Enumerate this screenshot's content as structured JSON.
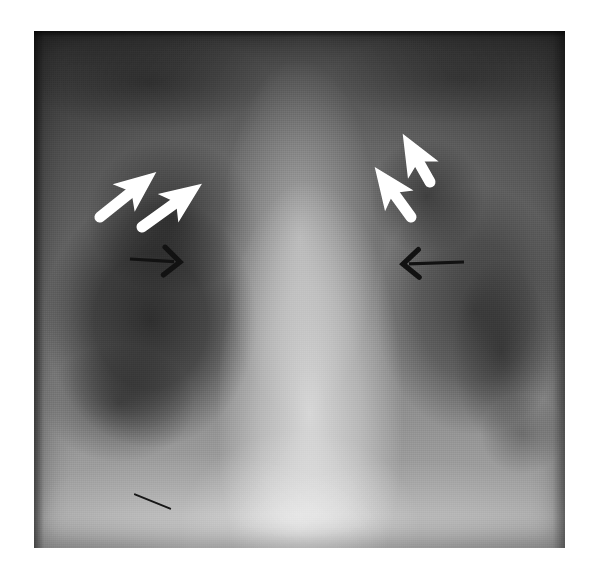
{
  "figure": {
    "type": "chest-radiograph",
    "modality": "X-ray",
    "view": "frontal PA chest",
    "background_color": "#ffffff",
    "plate": {
      "x": 34,
      "y": 31,
      "width": 531,
      "height": 517,
      "left_lung_tone": "lucent dark",
      "right_lung_tone": "mottled opacity",
      "mediastinum_tone": "bright central column"
    }
  },
  "annotations": {
    "white_arrows": [
      {
        "id": "white-arrow-left-outer",
        "color": "#ffffff",
        "points_to": "up-right",
        "tail_x": 66,
        "tail_y": 186,
        "head_x": 106,
        "head_y": 154
      },
      {
        "id": "white-arrow-left-inner",
        "color": "#ffffff",
        "points_to": "up-right",
        "tail_x": 108,
        "tail_y": 196,
        "head_x": 151,
        "head_y": 165
      },
      {
        "id": "white-arrow-right-inner",
        "color": "#ffffff",
        "points_to": "up-left",
        "tail_x": 377,
        "tail_y": 186,
        "head_x": 353,
        "head_y": 153
      },
      {
        "id": "white-arrow-right-outer",
        "color": "#ffffff",
        "points_to": "up-left",
        "tail_x": 396,
        "tail_y": 151,
        "head_x": 379,
        "head_y": 121
      }
    ],
    "black_arrows": [
      {
        "id": "black-arrow-left",
        "color": "#141414",
        "points_to": "right",
        "tail_x": 96,
        "tail_y": 228,
        "head_x": 146,
        "head_y": 231
      },
      {
        "id": "black-arrow-right",
        "color": "#141414",
        "points_to": "left",
        "tail_x": 430,
        "tail_y": 231,
        "head_x": 369,
        "head_y": 233
      }
    ],
    "artifacts": [
      {
        "id": "scratch-line",
        "color": "#191919",
        "x": 100,
        "y": 462,
        "length": 40,
        "angle_deg": 22
      }
    ]
  }
}
